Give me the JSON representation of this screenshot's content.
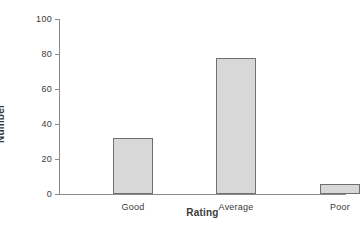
{
  "chart_data": {
    "type": "bar",
    "title": "",
    "subtitle": "",
    "xlabel": "Rating",
    "ylabel": "Number",
    "categories": [
      "Good",
      "Average",
      "Poor"
    ],
    "values": [
      32,
      78,
      6
    ],
    "series": [
      {
        "name": "Number",
        "values": [
          32,
          78,
          6
        ]
      }
    ],
    "ylim": [
      0,
      100
    ],
    "yticks": [
      0,
      20,
      40,
      60,
      80,
      100
    ],
    "ytick_labels": [
      "0",
      "20",
      "40",
      "60",
      "80",
      "100"
    ],
    "xtick_labels": [
      "Good",
      "Average",
      "Poor"
    ],
    "grid": false,
    "legend": false,
    "legend_position": "none",
    "annotations": [],
    "colors": {
      "bar_fill": "#d8d8d8",
      "bar_border": "#707070",
      "axis": "#8a8a8a",
      "text": "#3a3a3a",
      "background": "#ffffff"
    }
  }
}
